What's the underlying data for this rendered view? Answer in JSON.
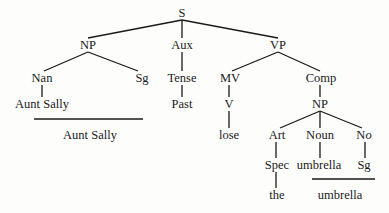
{
  "diagram": {
    "type": "syntax-tree",
    "nodes": {
      "s": "S",
      "np": "NP",
      "aux": "Aux",
      "vp": "VP",
      "nan": "Nan",
      "sg1": "Sg",
      "tense": "Tense",
      "mv": "MV",
      "comp": "Comp",
      "aunt_sally": "Aunt Sally",
      "past": "Past",
      "v": "V",
      "np2": "NP",
      "aunt_sally_surface": "Aunt Sally",
      "lose": "lose",
      "art": "Art",
      "noun": "Noun",
      "no_prefix": "N",
      "no_suffix": "o",
      "spec": "Spec",
      "umbrella": "umbrella",
      "sg2": "Sg",
      "the": "the",
      "umbrella_surface": "umbrella"
    },
    "edges": [
      [
        "S",
        "NP"
      ],
      [
        "S",
        "Aux"
      ],
      [
        "S",
        "VP"
      ],
      [
        "NP",
        "Nan"
      ],
      [
        "NP",
        "Sg"
      ],
      [
        "Nan",
        "Aunt Sally"
      ],
      [
        "Aux",
        "Tense"
      ],
      [
        "Tense",
        "Past"
      ],
      [
        "VP",
        "MV"
      ],
      [
        "VP",
        "Comp"
      ],
      [
        "MV",
        "V"
      ],
      [
        "V",
        "lose"
      ],
      [
        "Comp",
        "NP"
      ],
      [
        "NP",
        "Art"
      ],
      [
        "NP",
        "Noun"
      ],
      [
        "NP",
        "No"
      ],
      [
        "Art",
        "Spec"
      ],
      [
        "Spec",
        "the"
      ],
      [
        "Noun",
        "umbrella"
      ],
      [
        "No",
        "Sg"
      ]
    ],
    "colors": {
      "ink": "#1a1a1a",
      "background": "#fdfdfc"
    }
  }
}
